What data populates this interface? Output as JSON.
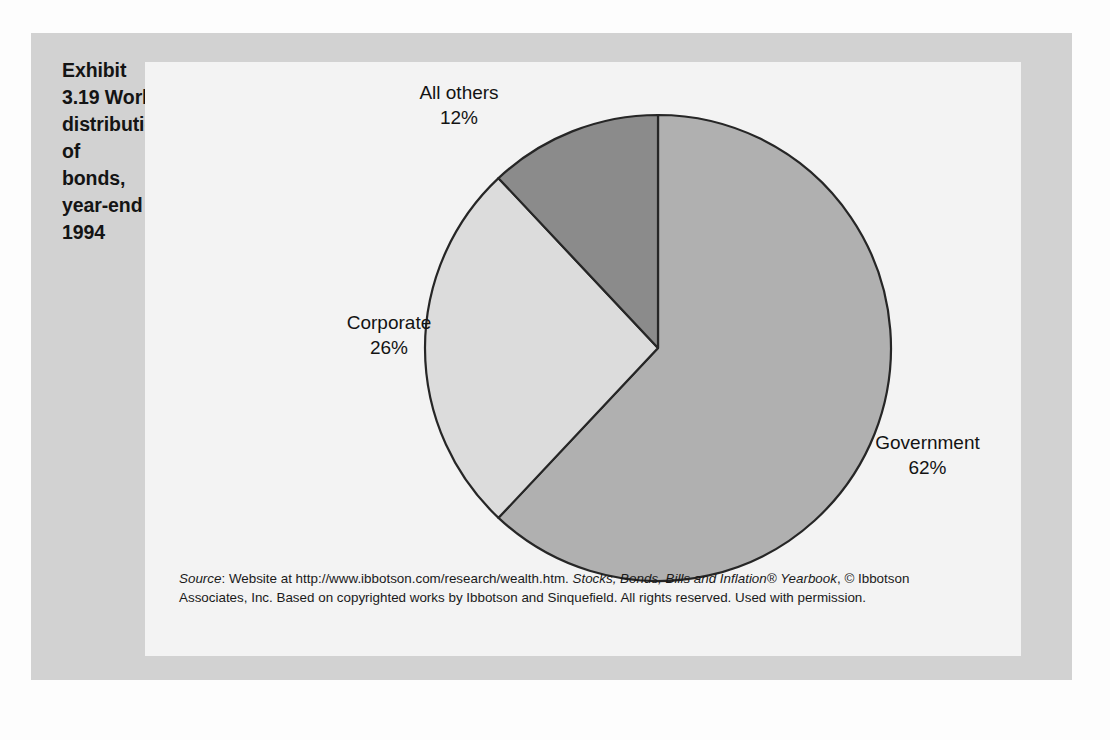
{
  "exhibit": {
    "title": "Exhibit 3.19  World distribution of bonds, year-end 1994",
    "title_lines": [
      "Exhibit 3.19  World",
      "distribution of",
      "bonds, year-end",
      "1994"
    ]
  },
  "colors": {
    "page_background": "#fdfdfd",
    "panel_background": "#d2d2d2",
    "card_background": "#f3f3f3",
    "slice_government": "#b0b0b0",
    "slice_corporate": "#dcdcdc",
    "slice_all_others": "#8b8b8b",
    "slice_outline": "#262626",
    "text": "#131313"
  },
  "labels": {
    "all_others": {
      "name": "All others",
      "pct": "12%"
    },
    "corporate": {
      "name": "Corporate",
      "pct": "26%"
    },
    "government": {
      "name": "Government",
      "pct": "62%"
    }
  },
  "source": {
    "lead": "Source",
    "line1_a": ": Website at http://www.ibbotson.com/research/wealth.htm. ",
    "line1_italic": "Stocks, Bonds, Bills and Inflation®",
    "line2_italic": "Yearbook",
    "line2_a": ", © Ibbotson Associates, Inc. Based on copyrighted works by Ibbotson and Sinquefield.",
    "line3": "All rights reserved. Used with permission.",
    "full_text": "Source: Website at http://www.ibbotson.com/research/wealth.htm. Stocks, Bonds, Bills and Inflation® Yearbook, © Ibbotson Associates, Inc. Based on copyrighted works by Ibbotson and Sinquefield. All rights reserved. Used with permission."
  },
  "chart_data": {
    "type": "pie",
    "title": "Exhibit 3.19  World distribution of bonds, year-end 1994",
    "categories": [
      "Government",
      "Corporate",
      "All others"
    ],
    "values": [
      62,
      26,
      12
    ],
    "unit": "%",
    "labels": [
      "Government 62%",
      "Corporate 26%",
      "All others 12%"
    ],
    "colors": [
      "#b0b0b0",
      "#dcdcdc",
      "#8b8b8b"
    ],
    "start_angle_deg": 0,
    "direction": "clockwise",
    "legend": "none",
    "grid": false,
    "xlabel": "",
    "ylabel": "",
    "exploded_center_vertex": true,
    "geometry": {
      "center_x": 658,
      "center_y": 348,
      "radius": 233,
      "boundary_angles_deg_from_12oclock_cw": [
        0,
        223.2,
        316.8
      ]
    }
  }
}
